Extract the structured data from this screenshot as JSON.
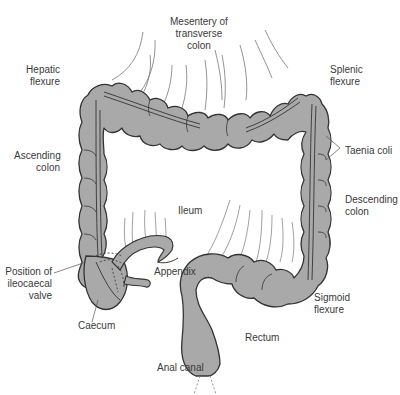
{
  "diagram": {
    "colors": {
      "organ_fill": "#a9a9a9",
      "outline": "#333333",
      "mesentery_lines": "#666666",
      "label_text": "#3a3a3a",
      "background": "#ffffff"
    }
  },
  "labels": {
    "mesentery": "Mesentery of\ntransverse\ncolon",
    "hepatic_flexure": "Hepatic\nflexure",
    "splenic_flexure": "Splenic\nflexure",
    "ascending_colon": "Ascending\ncolon",
    "taenia_coli": "Taenia coli",
    "descending_colon": "Descending\ncolon",
    "ileum": "Ileum",
    "position_ileocaecal_valve": "Position of\nileocaecal\nvalve",
    "appendix": "Appendix",
    "caecum": "Caecum",
    "sigmoid_flexure": "Sigmoid\nflexure",
    "rectum": "Rectum",
    "anal_canal": "Anal canal"
  }
}
